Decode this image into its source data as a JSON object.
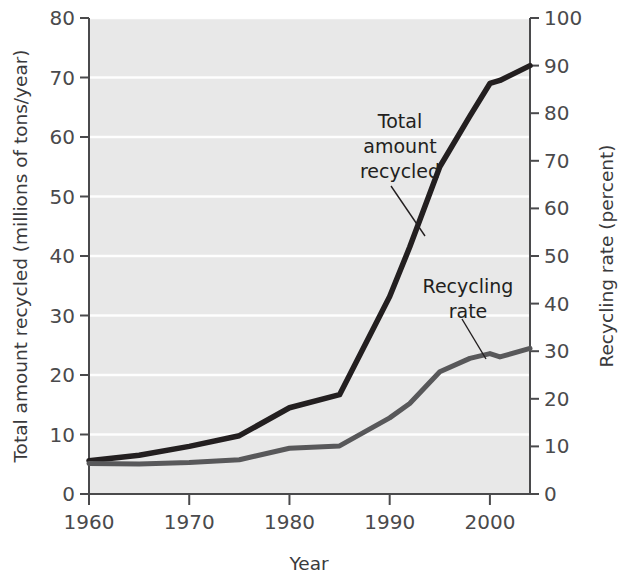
{
  "chart_data": {
    "type": "line",
    "title": "",
    "xlabel": "Year",
    "ylabel": "Total amount recycled (millions of tons/year)",
    "y2label": "Recycling rate (percent)",
    "xlim": [
      1960,
      2004
    ],
    "ylim": [
      0,
      80
    ],
    "y2lim": [
      0,
      100
    ],
    "xticks": [
      1960,
      1970,
      1980,
      1990,
      2000
    ],
    "xtick_labels": [
      "1960",
      "1970",
      "1980",
      "1990",
      "2000"
    ],
    "yticks": [
      0,
      10,
      20,
      30,
      40,
      50,
      60,
      70,
      80
    ],
    "ytick_labels": [
      "0",
      "10",
      "20",
      "30",
      "40",
      "50",
      "60",
      "70",
      "80"
    ],
    "y2ticks": [
      0,
      10,
      20,
      30,
      40,
      50,
      60,
      70,
      80,
      90,
      100
    ],
    "y2tick_labels": [
      "0",
      "10",
      "20",
      "30",
      "40",
      "50",
      "60",
      "70",
      "80",
      "90",
      "100"
    ],
    "grid": "horizontal",
    "plot_background": "#e8e8e8",
    "legend_position": "inline-annotations",
    "series": [
      {
        "name": "Total amount recycled",
        "axis": "left",
        "color": "#231f20",
        "x": [
          1960,
          1965,
          1970,
          1975,
          1980,
          1985,
          1990,
          1992,
          1995,
          1998,
          2000,
          2001,
          2004
        ],
        "values": [
          5.6,
          6.5,
          8.0,
          9.8,
          14.5,
          16.7,
          33.2,
          41.5,
          55.0,
          63.5,
          69.0,
          69.5,
          72.0
        ]
      },
      {
        "name": "Recycling rate",
        "axis": "right",
        "color": "#58585a",
        "x": [
          1960,
          1965,
          1970,
          1975,
          1980,
          1985,
          1990,
          1992,
          1995,
          1998,
          2000,
          2001,
          2004
        ],
        "values": [
          6.4,
          6.3,
          6.6,
          7.2,
          9.6,
          10.1,
          16.0,
          19.0,
          25.7,
          28.5,
          29.5,
          28.8,
          30.6
        ]
      }
    ],
    "annotations": [
      {
        "name": "total-amount-recycled",
        "lines": [
          "Total",
          "amount",
          "recycled"
        ],
        "text_x": 400,
        "text_y": 128,
        "leader_from": [
          391,
          186
        ],
        "leader_to": [
          425,
          236
        ]
      },
      {
        "name": "recycling-rate",
        "lines": [
          "Recycling",
          "rate"
        ],
        "text_x": 468,
        "text_y": 293,
        "leader_from": [
          462,
          319
        ],
        "leader_to": [
          486,
          359
        ]
      }
    ]
  },
  "axis": {
    "left_title": "Total amount recycled (millions of tons/year)",
    "right_title": "Recycling rate (percent)",
    "bottom_title": "Year"
  }
}
